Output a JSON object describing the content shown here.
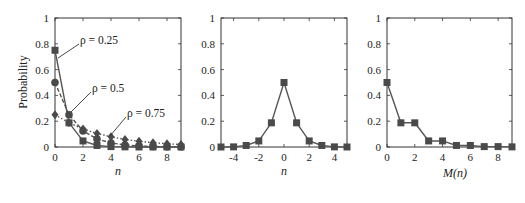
{
  "chart_data": [
    {
      "type": "line",
      "panel": "left",
      "xlabel": "n",
      "ylabel": "Probability",
      "xlim": [
        0,
        9
      ],
      "ylim": [
        0,
        1
      ],
      "xticks": [
        "0",
        "2",
        "4",
        "6",
        "8"
      ],
      "yticks": [
        "0",
        "0.2",
        "0.4",
        "0.6",
        "0.8",
        "1"
      ],
      "x": [
        0,
        1,
        2,
        3,
        4,
        5,
        6,
        7,
        8,
        9
      ],
      "series": [
        {
          "name": "ρ = 0.25",
          "marker": "square",
          "line": "solid",
          "values": [
            0.75,
            0.1875,
            0.047,
            0.012,
            0.003,
            0.001,
            0.0,
            0.0,
            0.0,
            0.0
          ]
        },
        {
          "name": "ρ = 0.5",
          "marker": "circle",
          "line": "dashed",
          "values": [
            0.5,
            0.25,
            0.125,
            0.0625,
            0.031,
            0.016,
            0.008,
            0.004,
            0.002,
            0.001
          ]
        },
        {
          "name": "ρ = 0.75",
          "marker": "diamond",
          "line": "dotted",
          "values": [
            0.25,
            0.1875,
            0.14,
            0.105,
            0.079,
            0.059,
            0.044,
            0.033,
            0.025,
            0.019
          ]
        }
      ],
      "annotations": [
        {
          "text": "ρ = 0.25",
          "points_to": [
            0,
            0.75
          ]
        },
        {
          "text": "ρ = 0.5",
          "points_to": [
            1,
            0.25
          ]
        },
        {
          "text": "ρ = 0.75",
          "points_to": [
            4,
            0.079
          ]
        }
      ],
      "grid": false
    },
    {
      "type": "line",
      "panel": "middle",
      "xlabel": "n",
      "ylabel": "",
      "xlim": [
        -5,
        5
      ],
      "ylim": [
        0,
        1
      ],
      "xticks": [
        "-4",
        "-2",
        "0",
        "2",
        "4"
      ],
      "yticks": [
        "0",
        "0.2",
        "0.4",
        "0.6",
        "0.8",
        "1"
      ],
      "x": [
        -5,
        -4,
        -3,
        -2,
        -1,
        0,
        1,
        2,
        3,
        4,
        5
      ],
      "series": [
        {
          "name": "P(n)",
          "marker": "square",
          "line": "solid",
          "values": [
            0.0,
            0.001,
            0.012,
            0.047,
            0.1875,
            0.5,
            0.1875,
            0.047,
            0.012,
            0.001,
            0.0
          ]
        }
      ],
      "grid": false
    },
    {
      "type": "line",
      "panel": "right",
      "xlabel": "M(n)",
      "ylabel": "",
      "xlim": [
        0,
        9
      ],
      "ylim": [
        0,
        1
      ],
      "xticks": [
        "0",
        "2",
        "4",
        "6",
        "8"
      ],
      "yticks": [
        "0",
        "0.2",
        "0.4",
        "0.6",
        "0.8",
        "1"
      ],
      "x": [
        0,
        1,
        2,
        3,
        4,
        5,
        6,
        7,
        8,
        9
      ],
      "series": [
        {
          "name": "P(M(n))",
          "marker": "square",
          "line": "solid",
          "values": [
            0.5,
            0.1875,
            0.1875,
            0.047,
            0.047,
            0.012,
            0.012,
            0.003,
            0.003,
            0.001
          ]
        }
      ],
      "grid": false
    }
  ],
  "labels": {
    "ylabel": "Probability",
    "panel1_xlabel": "n",
    "panel2_xlabel": "n",
    "panel3_xlabel": "M(n)",
    "annot_025": "ρ = 0.25",
    "annot_05": "ρ = 0.5",
    "annot_075": "ρ = 0.75"
  },
  "colors": {
    "axis": "#333333",
    "series": "#555555",
    "marker": "#4a4a4a"
  }
}
